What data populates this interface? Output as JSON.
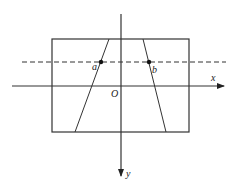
{
  "diagram": {
    "type": "coordinate-diagram",
    "colors": {
      "line": "#333333",
      "background": "#ffffff"
    },
    "axes": {
      "x_label": "x",
      "y_label": "y",
      "origin_label": "O"
    },
    "points": [
      {
        "label": "a"
      },
      {
        "label": "b"
      }
    ],
    "elements": {
      "rectangle": "field boundary",
      "dashed_line": "horizontal dashed line through a and b",
      "left_slant": "left slanted line",
      "right_slant": "right slanted line"
    }
  }
}
